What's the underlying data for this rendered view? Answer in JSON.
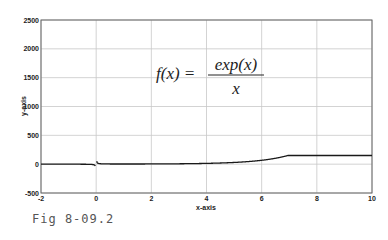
{
  "chart_data": {
    "type": "line",
    "title": "",
    "xlabel": "x-axis",
    "ylabel": "y-axis",
    "xlim": [
      -2,
      10
    ],
    "ylim": [
      -500,
      2500
    ],
    "xticks": [
      -2,
      0,
      2,
      4,
      6,
      8,
      10
    ],
    "yticks": [
      -500,
      0,
      500,
      1000,
      1500,
      2000,
      2500
    ],
    "grid": true,
    "annotation": "f(x) = exp(x) / x",
    "series": [
      {
        "name": "f(x)=exp(x)/x",
        "x": [
          -2,
          -1,
          -0.5,
          -0.1,
          0.1,
          0.5,
          1,
          2,
          3,
          4,
          5,
          6,
          7,
          8,
          9,
          10
        ],
        "y": [
          -0.07,
          -0.37,
          -1.21,
          -9.05,
          11.05,
          3.3,
          2.72,
          3.69,
          6.7,
          13.65,
          29.68,
          67.24,
          156.66,
          372.62,
          900.34,
          2202.65
        ]
      }
    ],
    "legend": null
  },
  "figure": {
    "formula_lhs": "f(x) =",
    "formula_num": "exp(x)",
    "formula_den": "x",
    "caption": "Fig 8-09.2"
  },
  "colors": {
    "line": "#1a1a1a",
    "grid": "#c8c8c8",
    "axis": "#555555"
  }
}
